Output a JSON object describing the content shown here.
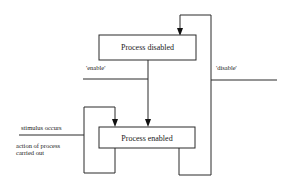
{
  "diagram": {
    "states": {
      "disabled": {
        "label": "Process disabled"
      },
      "enabled": {
        "label": "Process enabled"
      }
    },
    "transitions": {
      "enable": {
        "label": "'enable'"
      },
      "disable": {
        "label": "'disable'"
      },
      "stimulus": {
        "label": "stimulus occurs"
      },
      "action_line1": {
        "label": "action of process"
      },
      "action_line2": {
        "label": "carried out"
      }
    },
    "colors": {
      "line": "#2a2a2a",
      "background": "#ffffff",
      "text": "#1a1a1a"
    }
  }
}
